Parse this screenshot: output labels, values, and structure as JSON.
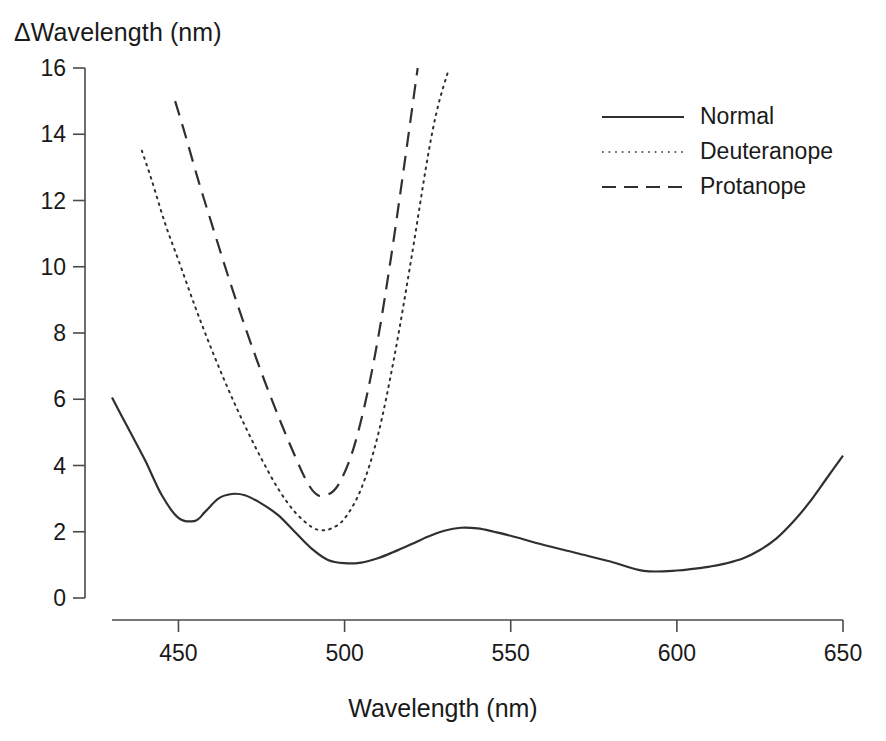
{
  "chart_data": {
    "type": "line",
    "title": "",
    "ylabel": "ΔWavelength (nm)",
    "xlabel": "Wavelength (nm)",
    "xlim": [
      430,
      650
    ],
    "ylim": [
      0,
      16
    ],
    "xticks": [
      450,
      500,
      550,
      600,
      650
    ],
    "yticks": [
      0,
      2,
      4,
      6,
      8,
      10,
      12,
      14,
      16
    ],
    "grid": false,
    "legend_position": "top-right",
    "series": [
      {
        "name": "Normal",
        "style": "solid",
        "color": "#303030",
        "x": [
          430,
          435,
          440,
          445,
          450,
          455,
          458,
          462,
          466,
          470,
          475,
          480,
          485,
          490,
          495,
          500,
          505,
          510,
          515,
          520,
          525,
          530,
          535,
          540,
          545,
          550,
          560,
          570,
          580,
          590,
          600,
          610,
          615,
          620,
          625,
          630,
          635,
          640,
          645,
          650
        ],
        "y": [
          6.05,
          5.1,
          4.15,
          3.1,
          2.42,
          2.33,
          2.6,
          3.0,
          3.14,
          3.1,
          2.85,
          2.5,
          2.0,
          1.5,
          1.15,
          1.05,
          1.07,
          1.2,
          1.4,
          1.62,
          1.85,
          2.03,
          2.12,
          2.1,
          2.0,
          1.88,
          1.6,
          1.35,
          1.1,
          0.82,
          0.83,
          0.95,
          1.05,
          1.2,
          1.45,
          1.8,
          2.3,
          2.9,
          3.6,
          4.3
        ]
      },
      {
        "name": "Deuteranope",
        "style": "dotted",
        "color": "#303030",
        "x": [
          439,
          442,
          446,
          450,
          455,
          460,
          465,
          470,
          475,
          480,
          485,
          490,
          493,
          496,
          500,
          505,
          510,
          515,
          520,
          525,
          528,
          531
        ],
        "y": [
          13.5,
          12.6,
          11.3,
          10.2,
          8.8,
          7.5,
          6.3,
          5.2,
          4.2,
          3.3,
          2.6,
          2.15,
          2.05,
          2.1,
          2.4,
          3.3,
          4.9,
          7.3,
          10.2,
          13.3,
          14.8,
          15.85
        ]
      },
      {
        "name": "Protanope",
        "style": "dashed",
        "color": "#303030",
        "x": [
          449,
          452,
          456,
          460,
          465,
          470,
          475,
          480,
          485,
          489,
          492,
          495,
          498,
          502,
          506,
          510,
          514,
          518,
          522
        ],
        "y": [
          15.0,
          14.0,
          12.6,
          11.3,
          9.7,
          8.2,
          6.8,
          5.5,
          4.3,
          3.45,
          3.1,
          3.12,
          3.4,
          4.3,
          5.8,
          7.8,
          10.3,
          13.1,
          16.0
        ]
      }
    ]
  },
  "axis": {
    "ytick_labels": [
      "16",
      "14",
      "12",
      "10",
      "8",
      "6",
      "4",
      "2",
      "0"
    ],
    "xtick_labels": [
      "450",
      "500",
      "550",
      "600",
      "650"
    ]
  },
  "legend": {
    "items": [
      {
        "label": "Normal",
        "style": "solid"
      },
      {
        "label": "Deuteranope",
        "style": "dotted"
      },
      {
        "label": "Protanope",
        "style": "dashed"
      }
    ]
  }
}
